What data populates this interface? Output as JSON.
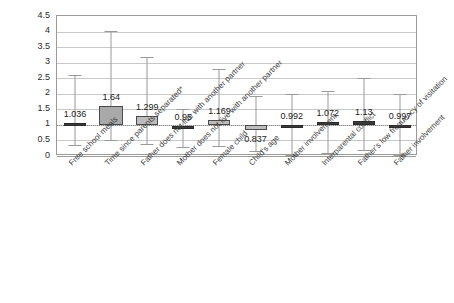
{
  "chart_data": {
    "type": "box",
    "title": "",
    "subtitle": "",
    "xlabel": "",
    "ylabel": "",
    "ylim": [
      0,
      4.5
    ],
    "ytick_labels": [
      "4.5",
      "4",
      "3.5",
      "3",
      "2.5",
      "2",
      "1.5",
      "1",
      "0.5",
      "0"
    ],
    "ytick_values": [
      4.5,
      4,
      3.5,
      3,
      2.5,
      2,
      1.5,
      1,
      0.5,
      0
    ],
    "grid": "horizontal",
    "legend": "none",
    "reference_line": 1,
    "categories": [
      "Free school meals",
      "Time since parents separated*",
      "Father does not live with another partner",
      "Mother does not live with another partner",
      "Female child",
      "Child's age",
      "Mother involvement",
      "Interparental conflict",
      "Father's low frequency of visitation",
      "Father involvement"
    ],
    "boxes": [
      {
        "category": "Free school meals",
        "label": "1.036",
        "label_position": "left",
        "point_estimate": 1.036,
        "box_low": 1.0,
        "box_high": 1.07,
        "whisker_low": 0.36,
        "whisker_high": 2.6,
        "style": "thin"
      },
      {
        "category": "Time since parents separated*",
        "label": "1.64",
        "label_position": "above",
        "point_estimate": 1.64,
        "box_low": 1.0,
        "box_high": 1.62,
        "whisker_low": 0.5,
        "whisker_high": 4.03,
        "style": "dark"
      },
      {
        "category": "Father does not live with another partner",
        "label": "1.299",
        "label_position": "above",
        "point_estimate": 1.299,
        "box_low": 1.0,
        "box_high": 1.3,
        "whisker_low": 0.4,
        "whisker_high": 3.18,
        "style": "normal"
      },
      {
        "category": "Mother does not live with another partner",
        "label": "0.95",
        "label_position": "above",
        "point_estimate": 0.95,
        "box_low": 0.9,
        "box_high": 0.98,
        "whisker_low": 0.28,
        "whisker_high": 1.52,
        "style": "thin"
      },
      {
        "category": "Female child",
        "label": "1.169",
        "label_position": "above",
        "point_estimate": 1.169,
        "box_low": 1.0,
        "box_high": 1.17,
        "whisker_low": 0.32,
        "whisker_high": 2.81,
        "style": "normal"
      },
      {
        "category": "Child's age",
        "label": "0.837",
        "label_position": "below",
        "point_estimate": 0.837,
        "box_low": 0.84,
        "box_high": 0.99,
        "whisker_low": 0.17,
        "whisker_high": 1.93,
        "style": "normal"
      },
      {
        "category": "Mother involvement",
        "label": "0.992",
        "label_position": "above",
        "point_estimate": 0.992,
        "box_low": 0.98,
        "box_high": 1.0,
        "whisker_low": 0.02,
        "whisker_high": 2.0,
        "style": "thin"
      },
      {
        "category": "Interparental conflict",
        "label": "1.072",
        "label_position": "above",
        "point_estimate": 1.072,
        "box_low": 1.0,
        "box_high": 1.08,
        "whisker_low": 0.09,
        "whisker_high": 2.09,
        "style": "thin"
      },
      {
        "category": "Father's low frequency of visitation",
        "label": "1.13",
        "label_position": "above",
        "point_estimate": 1.13,
        "box_low": 1.0,
        "box_high": 1.13,
        "whisker_low": 0.18,
        "whisker_high": 2.5,
        "style": "thin"
      },
      {
        "category": "Father involvement",
        "label": "0.997",
        "label_position": "above",
        "point_estimate": 0.997,
        "box_low": 0.99,
        "box_high": 1.0,
        "whisker_low": 0.03,
        "whisker_high": 2.0,
        "style": "thin"
      }
    ],
    "colors": {
      "box_fill": "#bdbdbd",
      "box_fill_highlight": "#a9a9a9",
      "box_edge": "#4a4a4a",
      "whisker": "#9a9a9a",
      "grid": "#c8c8c8",
      "frame": "#9b9b9b",
      "text": "#2b2b2b",
      "background": "#ffffff"
    }
  }
}
